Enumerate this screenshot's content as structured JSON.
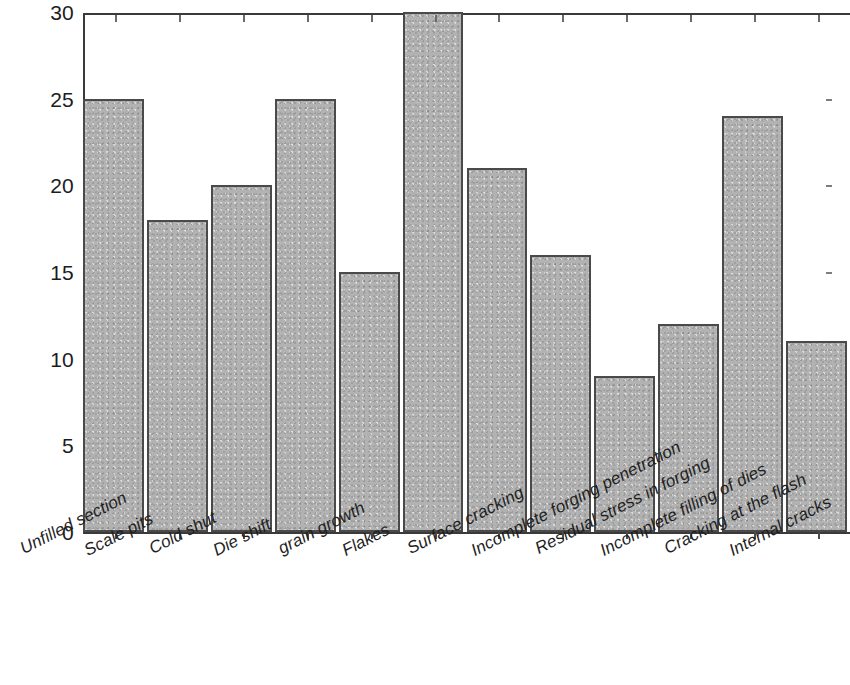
{
  "chart_data": {
    "type": "bar",
    "title": "",
    "subtitle": "",
    "xlabel": "",
    "ylabel": "",
    "ylim": [
      0,
      30
    ],
    "y_ticks": [
      0,
      5,
      10,
      15,
      20,
      25,
      30
    ],
    "grid": false,
    "legend": null,
    "bar_fill_color": "#b2b2b2",
    "bar_edge_color": "#4a4a4a",
    "axis_color": "#3a3a3a",
    "categories": [
      "Unfilled section",
      "Scale pits",
      "Cold shut",
      "Die shift",
      "grain growth",
      "Flakes",
      "Surface cracking",
      "Incomplete forging penetration",
      "Residual stress in forging",
      "Incomplete filling of dies",
      "Cracking at the flash",
      "Internal cracks"
    ],
    "values": [
      25,
      18,
      20,
      25,
      15,
      30,
      21,
      16,
      9,
      12,
      24,
      11
    ]
  }
}
